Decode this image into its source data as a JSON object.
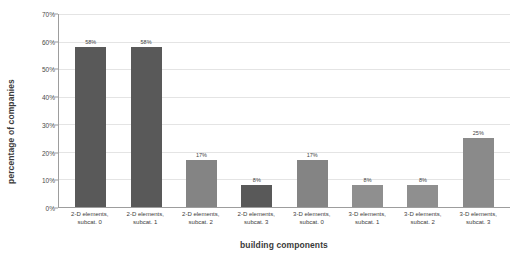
{
  "chart_data": {
    "type": "bar",
    "title": "",
    "xlabel": "building components",
    "ylabel": "percentage of companies",
    "categories": [
      "2-D elements, subcat. 0",
      "2-D elements, subcat. 1",
      "2-D elements, subcat. 2",
      "2-D elements, subcat. 3",
      "3-D elements, subcat. 0",
      "3-D elements, subcat. 1",
      "3-D elements, subcat. 2",
      "3-D elements, subcat. 3"
    ],
    "category_lines": [
      [
        "2-D elements,",
        "subcat. 0"
      ],
      [
        "2-D elements,",
        "subcat. 1"
      ],
      [
        "2-D elements,",
        "subcat. 2"
      ],
      [
        "2-D elements,",
        "subcat. 3"
      ],
      [
        "3-D elements,",
        "subcat. 0"
      ],
      [
        "3-D elements,",
        "subcat. 1"
      ],
      [
        "3-D elements,",
        "subcat. 2"
      ],
      [
        "3-D elements,",
        "subcat. 3"
      ]
    ],
    "values": [
      58,
      58,
      17,
      8,
      17,
      8,
      8,
      25
    ],
    "data_labels": [
      "58%",
      "58%",
      "17%",
      "8%",
      "17%",
      "8%",
      "8%",
      "25%"
    ],
    "bar_colors": [
      "#595959",
      "#595959",
      "#848484",
      "#595959",
      "#848484",
      "#8f8f8f",
      "#8f8f8f",
      "#8a8a8a"
    ],
    "ylim": [
      0,
      70
    ],
    "ytick_labels": [
      "0%",
      "10%",
      "20%",
      "30%",
      "40%",
      "50%",
      "60%",
      "70%"
    ],
    "ytick_values": [
      0,
      10,
      20,
      30,
      40,
      50,
      60,
      70
    ],
    "grid": true,
    "legend": "none",
    "axis_color": "#9d9d9d",
    "gridline_color": "#e4e4e4",
    "background": "#ffffff"
  }
}
